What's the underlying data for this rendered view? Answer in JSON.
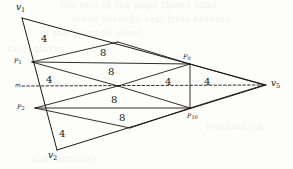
{
  "figure": {
    "type": "geometric-diagram",
    "background_color": "#fdfdfb",
    "ink_color": "#1a1714",
    "vertices": [
      {
        "id": "v1",
        "label": "v",
        "subscript": "1",
        "x": 22,
        "y": 18,
        "label_x": 16,
        "label_y": 2
      },
      {
        "id": "v2",
        "label": "v",
        "subscript": "2",
        "x": 57,
        "y": 150,
        "label_x": 48,
        "label_y": 150
      },
      {
        "id": "v5",
        "label": "v",
        "subscript": "5",
        "x": 266,
        "y": 85,
        "label_x": 271,
        "label_y": 78
      },
      {
        "id": "P1",
        "label": "P",
        "subscript": "1",
        "x": 32,
        "y": 62,
        "label_x": 14,
        "label_y": 57
      },
      {
        "id": "P2",
        "label": "P",
        "subscript": "2",
        "x": 35,
        "y": 108,
        "label_x": 17,
        "label_y": 103
      },
      {
        "id": "P9",
        "label": "P",
        "subscript": "9",
        "x": 190,
        "y": 64,
        "label_x": 183,
        "label_y": 53
      },
      {
        "id": "P10",
        "label": "P",
        "subscript": "10",
        "x": 190,
        "y": 108,
        "label_x": 187,
        "label_y": 112
      },
      {
        "id": "m",
        "label": "m",
        "subscript": "",
        "x": 24,
        "y": 86,
        "label_x": 15,
        "label_y": 81
      }
    ],
    "midline": {
      "name": "dashed-midline",
      "from": "m",
      "to": "v5",
      "style": "dashed",
      "y": 86,
      "x_start": 22,
      "x_end": 264
    },
    "edge_labels": [
      {
        "id": "lbl-top-left",
        "value": "4",
        "x": 41,
        "y": 33
      },
      {
        "id": "lbl-top-mid",
        "value": "8",
        "x": 100,
        "y": 47
      },
      {
        "id": "lbl-upper-band",
        "value": "8",
        "x": 108,
        "y": 66
      },
      {
        "id": "lbl-left-upper",
        "value": "4",
        "x": 46,
        "y": 74
      },
      {
        "id": "lbl-right-upper",
        "value": "4",
        "x": 165,
        "y": 76
      },
      {
        "id": "lbl-right-outer",
        "value": "4",
        "x": 204,
        "y": 76
      },
      {
        "id": "lbl-lower-band",
        "value": "8",
        "x": 111,
        "y": 94
      },
      {
        "id": "lbl-bottom-mid",
        "value": "8",
        "x": 119,
        "y": 112
      },
      {
        "id": "lbl-bottom-left",
        "value": "4",
        "x": 59,
        "y": 128
      }
    ],
    "background_bleed": [
      {
        "text": "the  rest  of  the  page  shows  faint",
        "x": 60,
        "y": 4,
        "size": 9
      },
      {
        "text": "bleed  through  text  from  reverse",
        "x": 72,
        "y": 18,
        "size": 9
      },
      {
        "text": "of  the  scanned  sheet",
        "x": 40,
        "y": 32,
        "size": 9
      },
      {
        "text": "faint  marks",
        "x": 12,
        "y": 48,
        "size": 9
      },
      {
        "text": "residual  ink",
        "x": 206,
        "y": 126,
        "size": 9
      },
      {
        "text": "scan  artifacts",
        "x": 30,
        "y": 158,
        "size": 9
      }
    ]
  }
}
